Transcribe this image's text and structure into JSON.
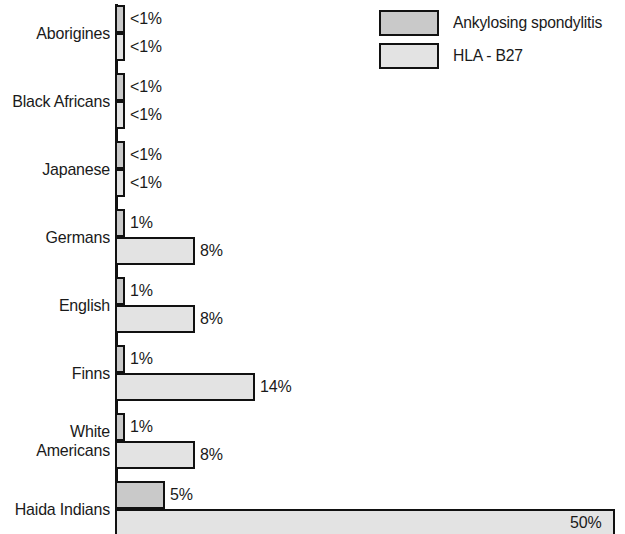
{
  "legend": {
    "position": "top-right",
    "items": [
      {
        "label": "Ankylosing spondylitis",
        "swatch": "s-as",
        "color": "#c9c9c9"
      },
      {
        "label": "HLA - B27",
        "swatch": "s-hla",
        "color": "#e3e3e3"
      }
    ]
  },
  "chart_data": {
    "type": "bar",
    "orientation": "horizontal",
    "title": "",
    "subtitle": "",
    "xlabel": "",
    "ylabel": "",
    "grid": false,
    "legend_position": "top-right",
    "xlim": [
      0,
      50
    ],
    "categories": [
      "Aborigines",
      "Black Africans",
      "Japanese",
      "Germans",
      "English",
      "Finns",
      "White\nAmericans",
      "Haida Indians"
    ],
    "series": [
      {
        "name": "Ankylosing spondylitis",
        "color": "#c9c9c9",
        "values": [
          0.5,
          0.5,
          0.5,
          1,
          1,
          1,
          1,
          5
        ],
        "labels": [
          "<1%",
          "<1%",
          "<1%",
          "1%",
          "1%",
          "1%",
          "1%",
          "5%"
        ],
        "label_placement": [
          "outside",
          "outside",
          "outside",
          "outside",
          "outside",
          "outside",
          "outside",
          "outside"
        ]
      },
      {
        "name": "HLA - B27",
        "color": "#e3e3e3",
        "values": [
          0.5,
          0.5,
          0.5,
          8,
          8,
          14,
          8,
          50
        ],
        "labels": [
          "<1%",
          "<1%",
          "<1%",
          "8%",
          "8%",
          "14%",
          "8%",
          "50%"
        ],
        "label_placement": [
          "outside",
          "outside",
          "outside",
          "outside",
          "outside",
          "outside",
          "outside",
          "inside"
        ]
      }
    ]
  },
  "layout": {
    "px_per_percent": 10.0,
    "min_bar_px": 10,
    "group_top_offsets": [
      5,
      73,
      141,
      209,
      277,
      345,
      413,
      481
    ],
    "bar_height": 28,
    "axis_x": 115,
    "label_vertical_centers": [
      33,
      101,
      169,
      237,
      305,
      373,
      441,
      509
    ]
  }
}
